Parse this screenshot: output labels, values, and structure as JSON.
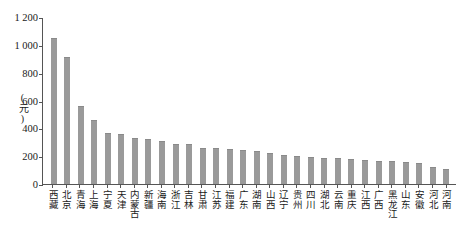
{
  "chart_data": {
    "type": "bar",
    "title": "",
    "subtitle": "",
    "xlabel": "",
    "ylabel": "(元)",
    "ylim": [
      0,
      1200
    ],
    "ytick_values": [
      0,
      200,
      400,
      600,
      800,
      1000,
      1200
    ],
    "ytick_labels": [
      "0",
      "200",
      "400",
      "600",
      "800",
      "1 000",
      "1 200"
    ],
    "grid": false,
    "legend": null,
    "bar_color": "#9a9a9a",
    "axis_color": "#555555",
    "categories": [
      "西藏",
      "北京",
      "青海",
      "上海",
      "宁夏",
      "天津",
      "内蒙古",
      "新疆",
      "海南",
      "浙江",
      "吉林",
      "甘肃",
      "江苏",
      "福建",
      "广东",
      "湖南",
      "山西",
      "辽宁",
      "贵州",
      "四川",
      "湖北",
      "云南",
      "重庆",
      "江西",
      "广西",
      "黑龙江",
      "山东",
      "安徽",
      "河北",
      "河南"
    ],
    "values": [
      1050,
      910,
      560,
      460,
      365,
      358,
      330,
      322,
      308,
      290,
      285,
      262,
      258,
      250,
      243,
      238,
      225,
      210,
      200,
      195,
      190,
      185,
      178,
      172,
      168,
      162,
      155,
      150,
      125,
      110
    ]
  }
}
